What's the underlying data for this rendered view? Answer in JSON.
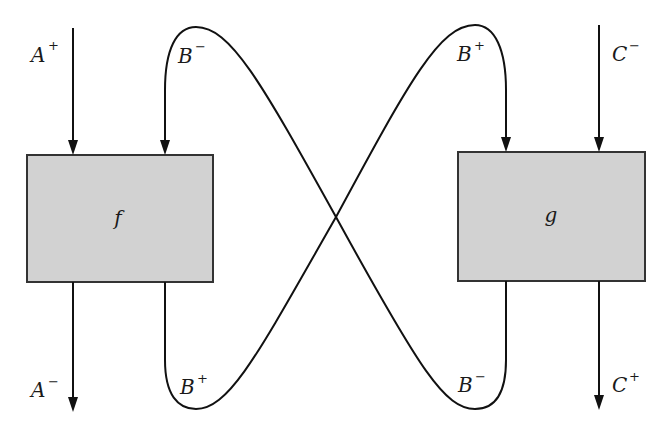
{
  "diagram": {
    "boxes": [
      {
        "id": "f",
        "label": "f",
        "x": 27,
        "y": 155,
        "w": 186,
        "h": 127,
        "fill": "#d2d2d2"
      },
      {
        "id": "g",
        "label": "g",
        "x": 458,
        "y": 152,
        "w": 187,
        "h": 129,
        "fill": "#d2d2d2"
      }
    ],
    "labels": {
      "a_plus": {
        "base": "A",
        "sup": "+"
      },
      "a_minus": {
        "base": "A",
        "sup": "−"
      },
      "b_minus_top": {
        "base": "B",
        "sup": "−"
      },
      "b_plus_bottom": {
        "base": "B",
        "sup": "+"
      },
      "b_plus_top": {
        "base": "B",
        "sup": "+"
      },
      "b_minus_bottom": {
        "base": "B",
        "sup": "−"
      },
      "c_minus": {
        "base": "C",
        "sup": "−"
      },
      "c_plus": {
        "base": "C",
        "sup": "+"
      }
    },
    "stroke_color": "#111111",
    "box_border_color": "#333333"
  },
  "top_text_fragment": ""
}
